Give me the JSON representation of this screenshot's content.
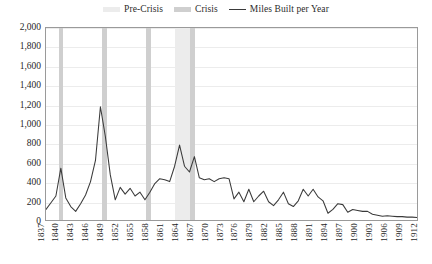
{
  "chart_data": {
    "type": "line",
    "title": "",
    "xlabel": "",
    "ylabel": "",
    "xlim": [
      1837,
      1912
    ],
    "ylim": [
      0,
      2000
    ],
    "ytick_values": [
      0,
      200,
      400,
      600,
      800,
      1000,
      1200,
      1400,
      1600,
      1800,
      2000
    ],
    "ytick_labels": [
      "0",
      "200",
      "400",
      "600",
      "800",
      "1,000",
      "1,200",
      "1,400",
      "1,600",
      "1,800",
      "2,000"
    ],
    "xtick_values": [
      1837,
      1840,
      1843,
      1846,
      1849,
      1852,
      1855,
      1858,
      1861,
      1864,
      1867,
      1870,
      1873,
      1876,
      1879,
      1882,
      1885,
      1888,
      1891,
      1894,
      1897,
      1900,
      1903,
      1906,
      1909,
      1912
    ],
    "xtick_labels": [
      "1837",
      "1840",
      "1843",
      "1846",
      "1849",
      "1852",
      "1855",
      "1858",
      "1861",
      "1864",
      "1867",
      "1870",
      "1873",
      "1876",
      "1879",
      "1882",
      "1885",
      "1888",
      "1891",
      "1894",
      "1897",
      "1900",
      "1903",
      "1906",
      "1909",
      "1912"
    ],
    "grid": true,
    "legend_position": "top-center",
    "series": [
      {
        "name": "Miles Built per Year",
        "color": "#3a3a3a",
        "x": [
          1837,
          1838,
          1839,
          1840,
          1841,
          1842,
          1843,
          1844,
          1845,
          1846,
          1847,
          1848,
          1849,
          1850,
          1851,
          1852,
          1853,
          1854,
          1855,
          1856,
          1857,
          1858,
          1859,
          1860,
          1861,
          1862,
          1863,
          1864,
          1865,
          1866,
          1867,
          1868,
          1869,
          1870,
          1871,
          1872,
          1873,
          1874,
          1875,
          1876,
          1877,
          1878,
          1879,
          1880,
          1881,
          1882,
          1883,
          1884,
          1885,
          1886,
          1887,
          1888,
          1889,
          1890,
          1891,
          1892,
          1893,
          1894,
          1895,
          1896,
          1897,
          1898,
          1899,
          1900,
          1901,
          1902,
          1903,
          1904,
          1905,
          1906,
          1907,
          1908,
          1909,
          1910,
          1911,
          1912
        ],
        "y": [
          110,
          180,
          250,
          540,
          230,
          140,
          90,
          170,
          260,
          400,
          620,
          1180,
          870,
          470,
          210,
          340,
          270,
          330,
          250,
          290,
          210,
          290,
          380,
          430,
          420,
          400,
          560,
          780,
          560,
          500,
          660,
          440,
          420,
          430,
          400,
          430,
          440,
          430,
          220,
          290,
          190,
          320,
          190,
          250,
          300,
          190,
          150,
          210,
          290,
          170,
          140,
          200,
          320,
          250,
          320,
          240,
          200,
          70,
          110,
          170,
          160,
          80,
          110,
          100,
          90,
          90,
          60,
          50,
          40,
          45,
          40,
          35,
          35,
          30,
          30,
          25
        ]
      }
    ],
    "bands": [
      {
        "category": "Crisis",
        "start": 1839.6,
        "end": 1840.5,
        "color": "#cfcfcf"
      },
      {
        "category": "Crisis",
        "start": 1848.3,
        "end": 1849.2,
        "color": "#cfcfcf"
      },
      {
        "category": "Crisis",
        "start": 1857.2,
        "end": 1858.1,
        "color": "#cfcfcf"
      },
      {
        "category": "Pre-Crisis",
        "start": 1862.9,
        "end": 1866.0,
        "color": "#ececec"
      },
      {
        "category": "Crisis",
        "start": 1866.0,
        "end": 1866.9,
        "color": "#cfcfcf"
      }
    ]
  },
  "legend": {
    "items": [
      {
        "label": "Pre-Crisis",
        "marker": "swatch",
        "color": "#ececec"
      },
      {
        "label": "Crisis",
        "marker": "swatch",
        "color": "#cfcfcf"
      },
      {
        "label": "Miles Built per Year",
        "marker": "line",
        "color": "#3a3a3a"
      }
    ]
  }
}
